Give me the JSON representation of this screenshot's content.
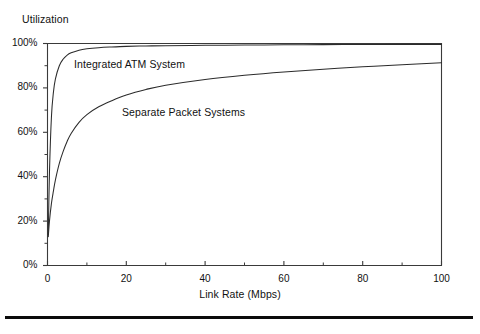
{
  "figure": {
    "y_axis_title": "Utilization",
    "x_axis_title": "Link Rate (Mbps)",
    "frame_color": "#3a3a3a",
    "curve_color": "#2b2b2b",
    "rule_color": "#0b0b0b"
  },
  "labels": {
    "atm": "Integrated ATM System",
    "separate": "Separate Packet Systems"
  },
  "ticks": {
    "y": [
      "0%",
      "20%",
      "40%",
      "60%",
      "80%",
      "100%"
    ],
    "x": [
      "0",
      "20",
      "40",
      "60",
      "80",
      "100"
    ]
  },
  "chart_data": {
    "type": "line",
    "title": "",
    "xlabel": "Link Rate (Mbps)",
    "ylabel": "Utilization",
    "xlim": [
      0,
      100
    ],
    "ylim": [
      0,
      100
    ],
    "xticks": [
      0,
      20,
      40,
      60,
      80,
      100
    ],
    "yticks": [
      0,
      20,
      40,
      60,
      80,
      100
    ],
    "xminorticks": [
      10,
      30,
      50,
      70,
      90
    ],
    "yminorticks": [
      10,
      30,
      50,
      70,
      90
    ],
    "grid": false,
    "legend": "inline-annotations",
    "ytick_suffix": "%",
    "series": [
      {
        "name": "Integrated ATM System",
        "x": [
          0.2,
          0.5,
          1,
          1.5,
          2,
          3,
          4,
          5,
          6,
          8,
          10,
          13,
          16,
          20,
          25,
          30,
          40,
          50,
          60,
          70,
          80,
          90,
          100
        ],
        "values": [
          14,
          42,
          67,
          78,
          84,
          90,
          93,
          94.8,
          95.8,
          97,
          97.6,
          98.1,
          98.4,
          98.7,
          98.9,
          99.0,
          99.2,
          99.3,
          99.4,
          99.5,
          99.55,
          99.6,
          99.6
        ]
      },
      {
        "name": "Separate Packet Systems",
        "x": [
          0.2,
          0.5,
          1,
          1.5,
          2,
          3,
          4,
          5,
          6,
          8,
          10,
          13,
          16,
          20,
          25,
          30,
          40,
          50,
          60,
          70,
          80,
          90,
          100
        ],
        "values": [
          13,
          20,
          28,
          33.5,
          38.5,
          46,
          51.5,
          56,
          59.5,
          64.5,
          68,
          71.5,
          74,
          76.8,
          79.3,
          81.2,
          83.8,
          85.7,
          87.2,
          88.4,
          89.5,
          90.4,
          91.3
        ]
      }
    ]
  }
}
